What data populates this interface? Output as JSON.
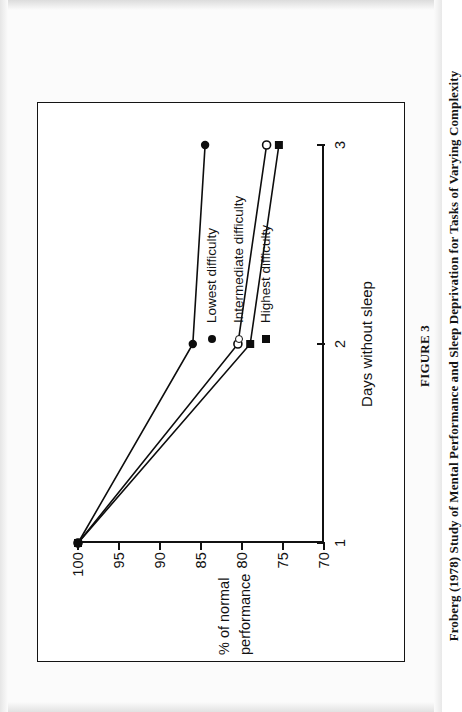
{
  "figure": {
    "caption_title": "FIGURE 3",
    "caption_text": "Froberg (1978) Study of Mental Performance and Sleep Deprivation for Tasks of Varying Complexity"
  },
  "legend": {
    "position": "inside-plot-left",
    "items": [
      {
        "label": "Lowest difficulty",
        "marker": "filled-circle-icon",
        "color": "#0d0d0d"
      },
      {
        "label": "Intermediate difficulty",
        "marker": "open-circle-icon",
        "color": "#0d0d0d"
      },
      {
        "label": "Highest difficulty",
        "marker": "filled-square-icon",
        "color": "#0d0d0d"
      }
    ]
  },
  "chart_data": {
    "type": "line",
    "title": "",
    "subtitle": "",
    "xlabel": "Days without sleep",
    "ylabel": "% of normal performance",
    "x": [
      1,
      2,
      3
    ],
    "xtick_labels": [
      "1",
      "2",
      "3"
    ],
    "ytick_labels": [
      "70",
      "75",
      "80",
      "85",
      "90",
      "95",
      "100"
    ],
    "xlim": [
      1,
      3
    ],
    "ylim": [
      70,
      100
    ],
    "grid": false,
    "legend_position": "inside-plot-left",
    "series": [
      {
        "name": "Lowest difficulty",
        "marker": "filled-circle",
        "color": "#0d0d0d",
        "values": [
          100,
          86,
          84.5
        ]
      },
      {
        "name": "Intermediate difficulty",
        "marker": "open-circle",
        "color": "#0d0d0d",
        "values": [
          100,
          80.5,
          77
        ]
      },
      {
        "name": "Highest difficulty",
        "marker": "filled-square",
        "color": "#0d0d0d",
        "values": [
          100,
          79,
          75.5
        ]
      }
    ]
  },
  "axes": {
    "y_title_line1": "% of normal",
    "y_title_line2": "performance"
  }
}
